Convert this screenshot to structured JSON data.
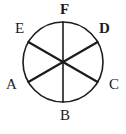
{
  "figure": {
    "kind": "circle-divided-into-sectors",
    "sector_count": 6,
    "stroke_color": "#1c1c1c",
    "fill_color": "#ffffff",
    "background_color": "#ffffff",
    "circle": {
      "center_x": 63,
      "center_y": 62,
      "radius": 40,
      "stroke_width": 1.6
    },
    "diameters": [
      {
        "name": "F-B",
        "from": "F",
        "to": "B",
        "stroke_width": 1.6
      },
      {
        "name": "E-C",
        "from": "E",
        "to": "C",
        "stroke_width": 2.2
      },
      {
        "name": "D-A",
        "from": "D",
        "to": "A",
        "stroke_width": 2.2
      }
    ],
    "labels": [
      {
        "id": "F",
        "text": "F",
        "bold": true,
        "position": "top",
        "angle_deg": 90
      },
      {
        "id": "D",
        "text": "D",
        "bold": true,
        "position": "upper-right",
        "angle_deg": 30
      },
      {
        "id": "C",
        "text": "C",
        "bold": false,
        "position": "lower-right",
        "angle_deg": -30
      },
      {
        "id": "B",
        "text": "B",
        "bold": false,
        "position": "bottom",
        "angle_deg": -90
      },
      {
        "id": "A",
        "text": "A",
        "bold": false,
        "position": "lower-left",
        "angle_deg": -150
      },
      {
        "id": "E",
        "text": "E",
        "bold": false,
        "position": "upper-left",
        "angle_deg": 150
      }
    ]
  }
}
